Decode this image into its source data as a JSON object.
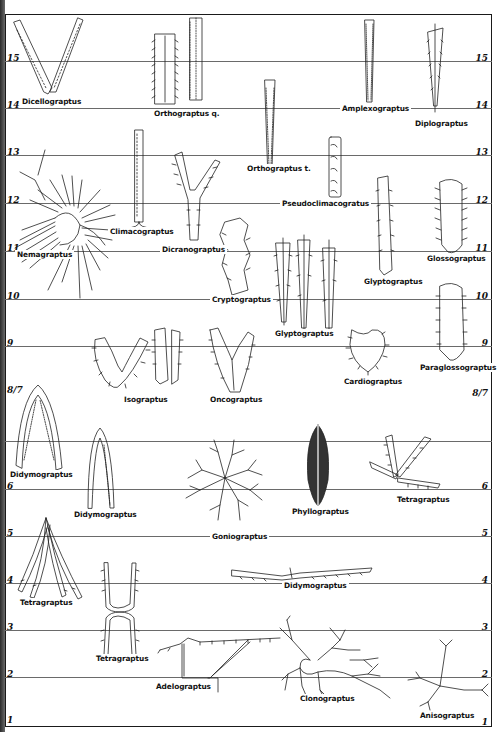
{
  "figure": {
    "colors": {
      "ink": "#111111",
      "zone_line": "#6a6a6a",
      "frame": "#1a1a1a",
      "paper": "#ffffff"
    }
  },
  "zones": [
    {
      "left_label": "15",
      "right_label": "15",
      "y": 61
    },
    {
      "left_label": "14",
      "right_label": "14",
      "y": 108
    },
    {
      "left_label": "13",
      "right_label": "13",
      "y": 155
    },
    {
      "left_label": "12",
      "right_label": "12",
      "y": 203
    },
    {
      "left_label": "11",
      "right_label": "11",
      "y": 251
    },
    {
      "left_label": "10",
      "right_label": "10",
      "y": 299
    },
    {
      "left_label": "9",
      "right_label": "9",
      "y": 346
    },
    {
      "left_label": "8/7",
      "right_label": "8/7",
      "y": 390
    },
    {
      "left_label": "6",
      "right_label": "6",
      "y": 489
    },
    {
      "left_label": "5",
      "right_label": "5",
      "y": 536
    },
    {
      "left_label": "4",
      "right_label": "4",
      "y": 583
    },
    {
      "left_label": "3",
      "right_label": "3",
      "y": 630
    },
    {
      "left_label": "2",
      "right_label": "2",
      "y": 677
    },
    {
      "left_label": "1",
      "right_label": "1",
      "y": 726
    }
  ],
  "specimens": [
    {
      "name": "Dicellograptus",
      "zone": "14-15"
    },
    {
      "name": "Orthograptus q.",
      "zone": "14-15"
    },
    {
      "name": "Amplexograptus",
      "zone": "14-15"
    },
    {
      "name": "Diplograptus",
      "zone": "14-15"
    },
    {
      "name": "Orthograptus t.",
      "zone": "13-14"
    },
    {
      "name": "Pseudoclimacogratus",
      "zone": "12-13"
    },
    {
      "name": "Climacograptus",
      "zone": "12-13"
    },
    {
      "name": "Nemagraptus",
      "zone": "10-12"
    },
    {
      "name": "Dicranograptus",
      "zone": "11-13"
    },
    {
      "name": "Glyptograptus",
      "zone": "10-12"
    },
    {
      "name": "Glossograptus",
      "zone": "11-12"
    },
    {
      "name": "Cryptograptus",
      "zone": "10-11"
    },
    {
      "name": "Glyptograptus",
      "zone": "9-11"
    },
    {
      "name": "Cardiograptus",
      "zone": "8-9"
    },
    {
      "name": "Paraglossograptus",
      "zone": "8-10"
    },
    {
      "name": "Isograptus",
      "zone": "8-9"
    },
    {
      "name": "Oncograptus",
      "zone": "8-9"
    },
    {
      "name": "Didymograptus",
      "zone": "6-8"
    },
    {
      "name": "Didymograptus",
      "zone": "5-6"
    },
    {
      "name": "Phyllograptus",
      "zone": "6-7"
    },
    {
      "name": "Tetragraptus",
      "zone": "6-7"
    },
    {
      "name": "Goniograptus",
      "zone": "5-6"
    },
    {
      "name": "Tetragraptus",
      "zone": "4-5"
    },
    {
      "name": "Didymograptus",
      "zone": "4"
    },
    {
      "name": "Tetragraptus",
      "zone": "2-4"
    },
    {
      "name": "Adelograptus",
      "zone": "2-3"
    },
    {
      "name": "Clonograptus",
      "zone": "1-3"
    },
    {
      "name": "Anisograptus",
      "zone": "1-2"
    }
  ]
}
